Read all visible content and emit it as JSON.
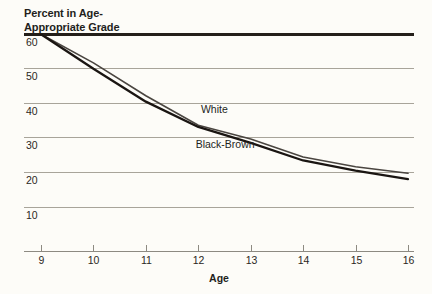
{
  "chart_data": {
    "type": "line",
    "xlabel": "Age",
    "ylabel": "Percent in Age-Appropriate Grade",
    "x": [
      9,
      10,
      11,
      12,
      13,
      14,
      15,
      16
    ],
    "xticklabels": [
      "9",
      "10",
      "11",
      "12",
      "13",
      "14",
      "15",
      "16"
    ],
    "yticklabels": [
      "60",
      "50",
      "40",
      "30",
      "20",
      "10"
    ],
    "yticks": [
      60,
      50,
      40,
      30,
      20,
      10
    ],
    "xlim": [
      9,
      16
    ],
    "ylim": [
      5,
      62
    ],
    "grid": true,
    "legend_position": "inline-annotation",
    "series": [
      {
        "name": "White",
        "color": "#4a4540",
        "linewidth": 1.6,
        "label_x": 12.05,
        "label_y": 37.0,
        "values": [
          59.8,
          51.5,
          42.0,
          33.5,
          29.5,
          24.3,
          21.5,
          19.6
        ]
      },
      {
        "name": "Black-Brown",
        "color": "#1a1512",
        "linewidth": 2.3,
        "label_x": 11.95,
        "label_y": 27.0,
        "values": [
          59.8,
          49.8,
          40.3,
          33.0,
          28.4,
          23.3,
          20.4,
          17.9
        ]
      }
    ]
  },
  "labels": {
    "title_line1": "Percent in Age-",
    "title_line2": "Appropriate Grade",
    "axis_x_title": "Age",
    "series_white": "White",
    "series_black_brown": "Black-Brown"
  }
}
